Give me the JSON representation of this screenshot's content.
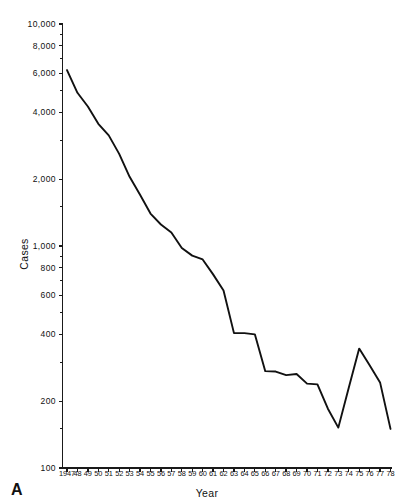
{
  "figure": {
    "panel_letter": "A",
    "line_color": "#111111",
    "axis_color": "#1a1a1a",
    "background_color": "#ffffff"
  },
  "chart_data": {
    "type": "line",
    "title": "",
    "xlabel": "Year",
    "ylabel": "Cases",
    "yscale": "log",
    "ylim": [
      100,
      10000
    ],
    "grid": false,
    "legend": null,
    "ytick_labels": [
      "10,000",
      "8,000",
      "6,000",
      "4,000",
      "2,000",
      "1,000",
      "800",
      "600",
      "400",
      "200",
      "100"
    ],
    "ytick_values": [
      10000,
      8000,
      6000,
      4000,
      2000,
      1000,
      800,
      600,
      400,
      200,
      100
    ],
    "yminor_ticks": [
      9000,
      7000,
      5000,
      3000,
      1500,
      900,
      700,
      500,
      300,
      150
    ],
    "xtick_labels": [
      "1947",
      "48",
      "49",
      "50",
      "51",
      "52",
      "53",
      "54",
      "55",
      "56",
      "57",
      "58",
      "59",
      "60",
      "61",
      "62",
      "63",
      "64",
      "65",
      "66",
      "67",
      "68",
      "69",
      "70",
      "71",
      "72",
      "73",
      "74",
      "75",
      "76",
      "77",
      "78"
    ],
    "x": [
      1947,
      1948,
      1949,
      1950,
      1951,
      1952,
      1953,
      1954,
      1955,
      1956,
      1957,
      1958,
      1959,
      1960,
      1961,
      1962,
      1963,
      1964,
      1965,
      1966,
      1967,
      1968,
      1969,
      1970,
      1971,
      1972,
      1973,
      1974,
      1975,
      1976,
      1977,
      1978
    ],
    "series": [
      {
        "name": "Cases",
        "values": [
          6200,
          4900,
          4250,
          3550,
          3150,
          2600,
          2050,
          1700,
          1400,
          1250,
          1150,
          980,
          905,
          870,
          745,
          630,
          405,
          405,
          400,
          273,
          272,
          262,
          265,
          240,
          238,
          185,
          152,
          230,
          345,
          290,
          243,
          150
        ]
      }
    ]
  }
}
